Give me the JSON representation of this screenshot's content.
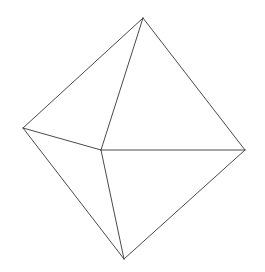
{
  "diagram": {
    "type": "wireframe-polyhedron",
    "shape": "bipyramid",
    "stroke_color": "#4a4a4a",
    "stroke_width": 1,
    "background": "#ffffff",
    "vertices": {
      "top": [
        143,
        18
      ],
      "left": [
        23,
        128
      ],
      "center": [
        101,
        150
      ],
      "right": [
        245,
        150
      ],
      "bottom": [
        124,
        259
      ]
    },
    "edges": [
      [
        "top",
        "left"
      ],
      [
        "top",
        "center"
      ],
      [
        "top",
        "right"
      ],
      [
        "left",
        "center"
      ],
      [
        "center",
        "right"
      ],
      [
        "left",
        "bottom"
      ],
      [
        "center",
        "bottom"
      ],
      [
        "right",
        "bottom"
      ]
    ]
  }
}
